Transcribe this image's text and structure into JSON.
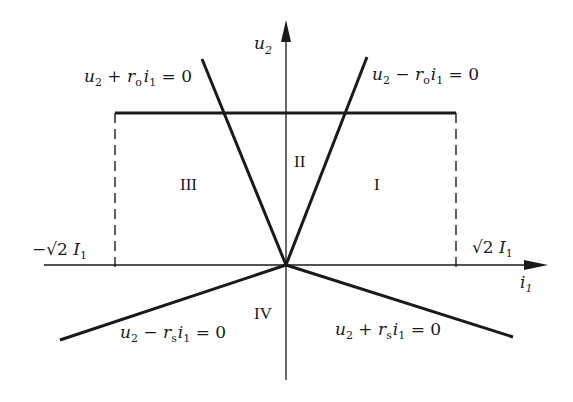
{
  "diagram": {
    "axes": {
      "x_label": "i",
      "x_label_sub": "1",
      "y_label": "u",
      "y_label_sub": "2"
    },
    "limits": {
      "neg_limit": {
        "prefix": "−√2 ",
        "var": "I",
        "sub": "1"
      },
      "pos_limit": {
        "prefix": "√2 ",
        "var": "I",
        "sub": "1"
      }
    },
    "lines": [
      {
        "id": "upper-left",
        "lhs": "u",
        "lhs_sub": "2",
        "op": " + ",
        "coef": "r",
        "coef_sub": "o",
        "var": "i",
        "var_sub": "1",
        "rhs": " = 0"
      },
      {
        "id": "upper-right",
        "lhs": "u",
        "lhs_sub": "2",
        "op": " − ",
        "coef": "r",
        "coef_sub": "o",
        "var": "i",
        "var_sub": "1",
        "rhs": " = 0"
      },
      {
        "id": "lower-left",
        "lhs": "u",
        "lhs_sub": "2",
        "op": " − ",
        "coef": "r",
        "coef_sub": "s",
        "var": "i",
        "var_sub": "1",
        "rhs": " = 0"
      },
      {
        "id": "lower-right",
        "lhs": "u",
        "lhs_sub": "2",
        "op": " + ",
        "coef": "r",
        "coef_sub": "s",
        "var": "i",
        "var_sub": "1",
        "rhs": " = 0"
      }
    ],
    "regions": {
      "I": "I",
      "II": "II",
      "III": "III",
      "IV": "IV"
    },
    "colors": {
      "ink": "#1a1a1a",
      "background": "#ffffff"
    }
  }
}
